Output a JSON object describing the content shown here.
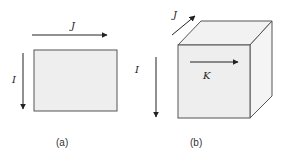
{
  "figure": {
    "panel_a": {
      "caption": "(a)",
      "labels": {
        "horizontal": "J",
        "vertical": "I"
      }
    },
    "panel_b": {
      "caption": "(b)",
      "labels": {
        "depth": "J",
        "vertical": "I",
        "horizontal": "K"
      }
    },
    "colors": {
      "face": "#eeeeee",
      "top": "#f2f2f2",
      "side": "#f4f4f4",
      "stroke": "#444444",
      "arrow": "#222222"
    }
  }
}
